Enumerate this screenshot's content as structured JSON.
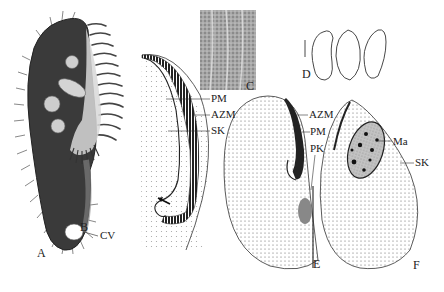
{
  "figure": {
    "panels": [
      {
        "id": "A",
        "label": "A"
      },
      {
        "id": "B",
        "label": "B"
      },
      {
        "id": "C",
        "label": "C"
      },
      {
        "id": "D",
        "label": "D"
      },
      {
        "id": "E",
        "label": "E"
      },
      {
        "id": "F",
        "label": "F"
      }
    ],
    "annotations": {
      "A": [
        "CV"
      ],
      "B": [
        "PM",
        "AZM",
        "SK"
      ],
      "E": [
        "AZM",
        "PM",
        "PK"
      ],
      "F": [
        "Ma",
        "SK"
      ]
    }
  },
  "labels": {
    "panel_a": "A",
    "panel_b": "B",
    "panel_c": "C",
    "panel_d": "D",
    "panel_e": "E",
    "panel_f": "F",
    "a_cv": "CV",
    "b_pm": "PM",
    "b_azm": "AZM",
    "b_sk": "SK",
    "e_azm": "AZM",
    "e_pm": "PM",
    "e_pk": "PK",
    "f_ma": "Ma",
    "f_sk": "SK"
  },
  "colors": {
    "ink": "#222222",
    "cell_dark": "#3a3a3a",
    "inset_gray": "#9a9a9a",
    "nucleus_fill": "#b8b8b8"
  }
}
